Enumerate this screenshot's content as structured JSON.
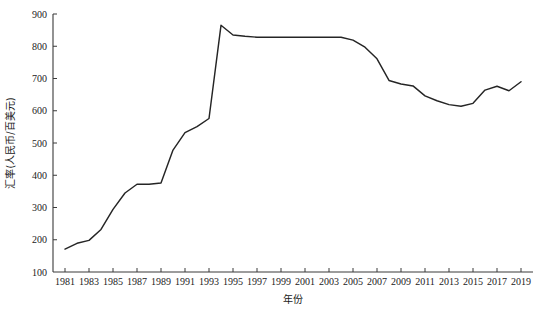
{
  "chart_data": {
    "type": "line",
    "title": "",
    "xlabel": "年份",
    "ylabel": "汇率(人民币/百美元)",
    "xlim": [
      1980,
      2020
    ],
    "ylim": [
      100,
      900
    ],
    "ytick_step": 100,
    "xtick_step": 2,
    "grid": false,
    "legend": null,
    "xticklabels": [
      "1981",
      "1983",
      "1985",
      "1987",
      "1989",
      "1991",
      "1993",
      "1995",
      "1997",
      "1999",
      "2001",
      "2003",
      "2005",
      "2007",
      "2009",
      "2011",
      "2013",
      "2015",
      "2017",
      "2019"
    ],
    "yticklabels": [
      "100",
      "200",
      "300",
      "400",
      "500",
      "600",
      "700",
      "800",
      "900"
    ],
    "x": [
      1981,
      1982,
      1983,
      1984,
      1985,
      1986,
      1987,
      1988,
      1989,
      1990,
      1991,
      1992,
      1993,
      1994,
      1995,
      1996,
      1997,
      1998,
      1999,
      2000,
      2001,
      2002,
      2003,
      2004,
      2005,
      2006,
      2007,
      2008,
      2009,
      2010,
      2011,
      2012,
      2013,
      2014,
      2015,
      2016,
      2017,
      2018,
      2019
    ],
    "values": [
      171,
      189,
      198,
      232,
      294,
      345,
      372,
      372,
      376,
      478,
      532,
      551,
      576,
      865,
      835,
      831,
      828,
      828,
      828,
      828,
      828,
      828,
      828,
      828,
      819,
      797,
      761,
      694,
      683,
      677,
      646,
      631,
      619,
      614,
      623,
      664,
      676,
      662,
      690
    ],
    "series": [
      {
        "name": "汇率(人民币/百美元)",
        "values": [
          171,
          189,
          198,
          232,
          294,
          345,
          372,
          372,
          376,
          478,
          532,
          551,
          576,
          865,
          835,
          831,
          828,
          828,
          828,
          828,
          828,
          828,
          828,
          828,
          819,
          797,
          761,
          694,
          683,
          677,
          646,
          631,
          619,
          614,
          623,
          664,
          676,
          662,
          690
        ]
      }
    ],
    "line_color": "#252525",
    "axis_color": "#3a3a3a",
    "background_color": "#ffffff"
  }
}
